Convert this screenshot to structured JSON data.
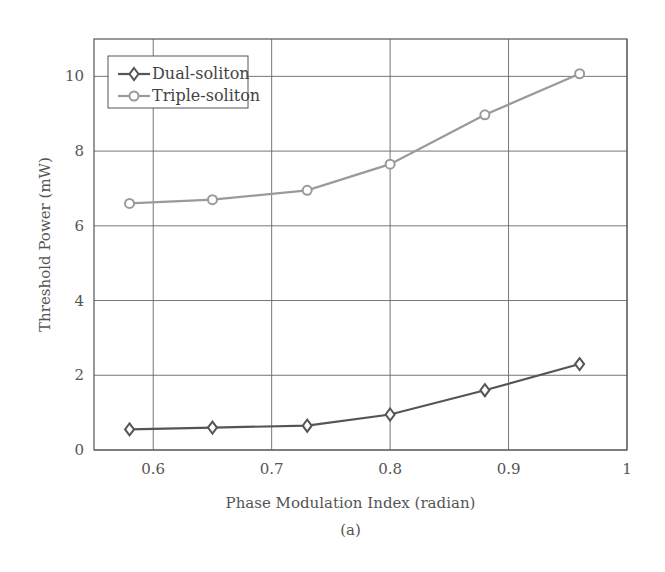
{
  "chart_data": {
    "type": "line",
    "title": "",
    "xlabel": "Phase Modulation Index (radian)",
    "ylabel": "Threshold Power (mW)",
    "caption": "(a)",
    "xlim": [
      0.55,
      1.0
    ],
    "ylim": [
      0,
      11
    ],
    "xticks": [
      0.6,
      0.7,
      0.8,
      0.9,
      1
    ],
    "xtick_labels": [
      "0.6",
      "0.7",
      "0.8",
      "0.9",
      "1"
    ],
    "yticks": [
      0,
      2,
      4,
      6,
      8,
      10
    ],
    "ytick_labels": [
      "0",
      "2",
      "4",
      "6",
      "8",
      "10"
    ],
    "grid": true,
    "legend_position": "upper left",
    "x": [
      0.58,
      0.65,
      0.73,
      0.8,
      0.88,
      0.96
    ],
    "series": [
      {
        "name": "Dual-soliton",
        "marker": "diamond",
        "color": "#555555",
        "values": [
          0.55,
          0.6,
          0.65,
          0.95,
          1.6,
          2.3
        ]
      },
      {
        "name": "Triple-soliton",
        "marker": "circle",
        "color": "#9a9a9a",
        "values": [
          6.6,
          6.7,
          6.95,
          7.65,
          8.97,
          10.07
        ]
      }
    ]
  }
}
